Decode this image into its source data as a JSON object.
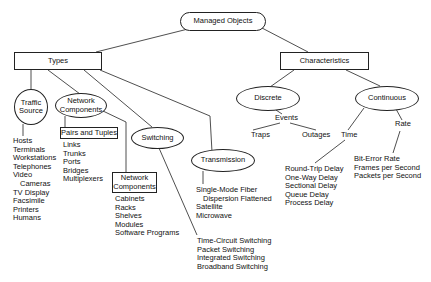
{
  "diagram": {
    "root": "Managed Objects",
    "types": {
      "label": "Types",
      "traffic_source": {
        "label": "Traffic Source",
        "items": [
          "Hosts",
          "Terminals",
          "Workstations",
          "Telephones",
          "Video",
          "Cameras",
          "TV Display",
          "Facsimile",
          "Printers",
          "Humans"
        ]
      },
      "network_components": {
        "label": "Network Components",
        "pairs_and_tuples": {
          "label": "Pairs and Tuples",
          "items": [
            "Links",
            "Trunks",
            "Ports",
            "Bridges",
            "Multiplexers"
          ]
        },
        "network_components_box": {
          "label": "Network Components",
          "items": [
            "Cabinets",
            "Racks",
            "Shelves",
            "Modules",
            "Software Programs"
          ]
        }
      },
      "switching": {
        "label": "Switching",
        "items": [
          "Time-Circuit Switching",
          "Packet Switching",
          "Integrated Switching",
          "Broadband Switching"
        ]
      },
      "transmission": {
        "label": "Transmission",
        "items": [
          "Single-Mode Fiber",
          "Dispersion Flattened",
          "Satellite",
          "Microwave"
        ]
      }
    },
    "characteristics": {
      "label": "Characteristics",
      "discrete": {
        "label": "Discrete",
        "events": {
          "label": "Events",
          "items": [
            "Traps",
            "Outages"
          ]
        }
      },
      "continuous": {
        "label": "Continuous",
        "time": {
          "label": "Time",
          "items": [
            "Round-Trip Delay",
            "One-Way Delay",
            "Sectional Delay",
            "Queue Delay",
            "Process Delay"
          ]
        },
        "rate": {
          "label": "Rate",
          "items": [
            "Bit-Error Rate",
            "Frames per Second",
            "Packets per Second"
          ]
        }
      }
    }
  }
}
